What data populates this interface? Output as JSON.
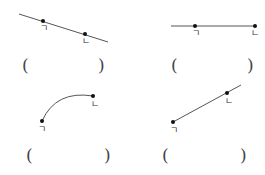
{
  "colors": {
    "line": "#555555",
    "point": "#111111",
    "text": "#333333"
  },
  "panels": [
    {
      "id": "panel-1",
      "figure": "line",
      "points": [
        {
          "label": "ㄱ",
          "x": 43,
          "y": 21
        },
        {
          "label": "ㄴ",
          "x": 85,
          "y": 34
        }
      ],
      "answer_open": "(",
      "answer_close": ")"
    },
    {
      "id": "panel-2",
      "figure": "ray",
      "points": [
        {
          "label": "ㄱ",
          "x": 195,
          "y": 26
        },
        {
          "label": "ㄴ",
          "x": 255,
          "y": 26
        }
      ],
      "answer_open": "(",
      "answer_close": ")"
    },
    {
      "id": "panel-3",
      "figure": "curve",
      "points": [
        {
          "label": "ㄱ",
          "x": 42,
          "y": 121
        },
        {
          "label": "ㄴ",
          "x": 93,
          "y": 96
        }
      ],
      "answer_open": "(",
      "answer_close": ")"
    },
    {
      "id": "panel-4",
      "figure": "ray",
      "points": [
        {
          "label": "ㄱ",
          "x": 173,
          "y": 122
        },
        {
          "label": "ㄴ",
          "x": 227,
          "y": 93
        }
      ],
      "answer_open": "(",
      "answer_close": ")"
    }
  ]
}
